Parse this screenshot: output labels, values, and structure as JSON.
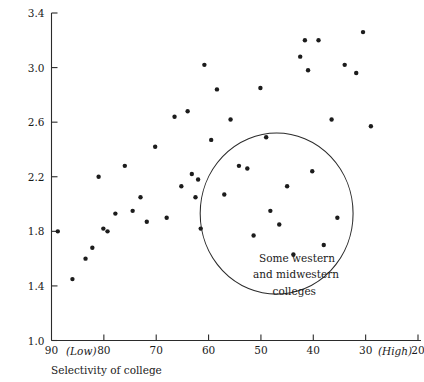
{
  "chart_data": {
    "type": "scatter",
    "title": "",
    "xlabel": "Selectivity of college",
    "ylabel": "",
    "xlim": [
      90,
      20
    ],
    "ylim": [
      1.0,
      3.4
    ],
    "x_axis_reversed": true,
    "grid": false,
    "legend": null,
    "x_ticks": [
      90,
      80,
      70,
      60,
      50,
      40,
      30,
      20
    ],
    "x_tick_labels": [
      "90",
      "80",
      "70",
      "60",
      "50",
      "40",
      "30",
      "20"
    ],
    "x_low_marker": "(Low)",
    "x_high_marker": "(High)",
    "y_ticks": [
      1.0,
      1.4,
      1.8,
      2.2,
      2.6,
      3.0,
      3.4
    ],
    "y_tick_labels": [
      "1.0",
      "1.4",
      "1.8",
      "2.2",
      "2.6",
      "3.0",
      "3.4"
    ],
    "points": [
      {
        "x": 88.8,
        "y": 1.8
      },
      {
        "x": 86.0,
        "y": 1.45
      },
      {
        "x": 83.5,
        "y": 1.6
      },
      {
        "x": 82.2,
        "y": 1.68
      },
      {
        "x": 81.0,
        "y": 2.2
      },
      {
        "x": 80.1,
        "y": 1.82
      },
      {
        "x": 79.3,
        "y": 1.8
      },
      {
        "x": 77.8,
        "y": 1.93
      },
      {
        "x": 76.0,
        "y": 2.28
      },
      {
        "x": 74.5,
        "y": 1.95
      },
      {
        "x": 73.0,
        "y": 2.05
      },
      {
        "x": 71.8,
        "y": 1.87
      },
      {
        "x": 70.2,
        "y": 2.42
      },
      {
        "x": 68.0,
        "y": 1.9
      },
      {
        "x": 66.5,
        "y": 2.64
      },
      {
        "x": 65.2,
        "y": 2.13
      },
      {
        "x": 64.0,
        "y": 2.68
      },
      {
        "x": 63.2,
        "y": 2.22
      },
      {
        "x": 62.5,
        "y": 2.05
      },
      {
        "x": 62.0,
        "y": 2.18
      },
      {
        "x": 61.5,
        "y": 1.82
      },
      {
        "x": 60.8,
        "y": 3.02
      },
      {
        "x": 59.5,
        "y": 2.47
      },
      {
        "x": 58.4,
        "y": 2.84
      },
      {
        "x": 57.0,
        "y": 2.07
      },
      {
        "x": 55.8,
        "y": 2.62
      },
      {
        "x": 54.2,
        "y": 2.28
      },
      {
        "x": 52.6,
        "y": 2.26
      },
      {
        "x": 51.4,
        "y": 1.77
      },
      {
        "x": 50.1,
        "y": 2.85
      },
      {
        "x": 49.0,
        "y": 2.49
      },
      {
        "x": 48.2,
        "y": 1.95
      },
      {
        "x": 46.5,
        "y": 1.85
      },
      {
        "x": 45.0,
        "y": 2.13
      },
      {
        "x": 43.8,
        "y": 1.63
      },
      {
        "x": 42.5,
        "y": 3.08
      },
      {
        "x": 41.6,
        "y": 3.2
      },
      {
        "x": 41.0,
        "y": 2.98
      },
      {
        "x": 40.2,
        "y": 2.24
      },
      {
        "x": 39.0,
        "y": 3.2
      },
      {
        "x": 38.0,
        "y": 1.7
      },
      {
        "x": 36.5,
        "y": 2.62
      },
      {
        "x": 35.4,
        "y": 1.9
      },
      {
        "x": 34.0,
        "y": 3.02
      },
      {
        "x": 31.8,
        "y": 2.96
      },
      {
        "x": 30.5,
        "y": 3.26
      },
      {
        "x": 29.0,
        "y": 2.57
      }
    ],
    "annotations": [
      {
        "text_lines": [
          "Some western",
          "and midwestern",
          "colleges"
        ],
        "shape": "circle",
        "circle_center": {
          "x": 47.0,
          "y": 1.93
        },
        "circle_radius_x_units": 14.6,
        "circle_radius_y_units": 0.59
      }
    ]
  },
  "axis": {
    "x_title": "Selectivity of college",
    "low_label": "(Low)",
    "high_label": "(High)"
  },
  "annotation": {
    "line1": "Some western",
    "line2": "and midwestern",
    "line3": "colleges"
  },
  "colors": {
    "point": "#1c1c1c",
    "axis": "#2b2b2b",
    "background": "#ffffff",
    "text": "#1a1a1a"
  }
}
